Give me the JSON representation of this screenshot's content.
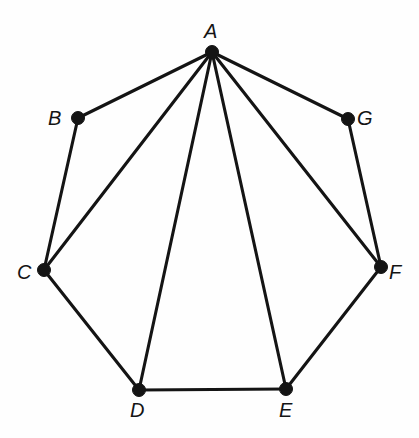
{
  "figure": {
    "name": "graph-diagram",
    "width": 419,
    "height": 438,
    "background_color": "#fefefe",
    "ink_color": "#141414",
    "edge_stroke_width": 3.1,
    "vertex_radius": 6.5
  },
  "graph_data": {
    "type": "graph",
    "vertex_count": 7,
    "edge_count": 12,
    "vertices": [
      {
        "id": "A",
        "label": "A",
        "x": 212,
        "y": 52,
        "label_x": 204,
        "label_y": 21,
        "label_position": "above"
      },
      {
        "id": "B",
        "label": "B",
        "x": 78,
        "y": 118,
        "label_x": 48,
        "label_y": 108,
        "label_position": "left"
      },
      {
        "id": "C",
        "label": "C",
        "x": 44,
        "y": 270,
        "label_x": 17,
        "label_y": 262,
        "label_position": "left"
      },
      {
        "id": "D",
        "label": "D",
        "x": 139,
        "y": 390,
        "label_x": 130,
        "label_y": 400,
        "label_position": "below"
      },
      {
        "id": "E",
        "label": "E",
        "x": 286,
        "y": 389,
        "label_x": 279,
        "label_y": 400,
        "label_position": "below"
      },
      {
        "id": "F",
        "label": "F",
        "x": 381,
        "y": 267,
        "label_x": 389,
        "label_y": 262,
        "label_position": "right"
      },
      {
        "id": "G",
        "label": "G",
        "x": 348,
        "y": 119,
        "label_x": 357,
        "label_y": 108,
        "label_position": "right"
      }
    ],
    "edges": [
      {
        "from": "A",
        "to": "B"
      },
      {
        "from": "A",
        "to": "C"
      },
      {
        "from": "A",
        "to": "D"
      },
      {
        "from": "A",
        "to": "E"
      },
      {
        "from": "A",
        "to": "F"
      },
      {
        "from": "A",
        "to": "G"
      },
      {
        "from": "B",
        "to": "C"
      },
      {
        "from": "C",
        "to": "D"
      },
      {
        "from": "D",
        "to": "E"
      },
      {
        "from": "E",
        "to": "F"
      },
      {
        "from": "F",
        "to": "G"
      }
    ]
  }
}
